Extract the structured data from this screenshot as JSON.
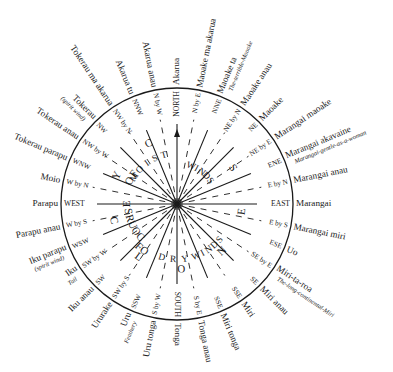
{
  "diagram": {
    "type": "wind-compass",
    "center": [
      177,
      204
    ],
    "radius": 116,
    "points": [
      {
        "label": "NORTH",
        "name": "Akarua",
        "sub": ""
      },
      {
        "label": "N by E",
        "name": "Maoake ma akarua",
        "sub": ""
      },
      {
        "label": "NNE",
        "name": "Maoake ta",
        "sub": "The-terrible-Maoake"
      },
      {
        "label": "NE by N",
        "name": "Maoake anau",
        "sub": ""
      },
      {
        "label": "NE",
        "name": "Maoake",
        "sub": ""
      },
      {
        "label": "NE by E",
        "name": "Marangai maoake",
        "sub": ""
      },
      {
        "label": "ENE",
        "name": "Marangai akavaine",
        "sub": "Marangai-gentle-as-a-woman"
      },
      {
        "label": "E by N",
        "name": "Marangai anau",
        "sub": ""
      },
      {
        "label": "EAST",
        "name": "Marangai",
        "sub": ""
      },
      {
        "label": "E by S",
        "name": "Marangai miri",
        "sub": ""
      },
      {
        "label": "ESE",
        "name": "Uo",
        "sub": ""
      },
      {
        "label": "SE by E",
        "name": "Miri-ta-roa",
        "sub": "The-long-continental-Miri"
      },
      {
        "label": "SE",
        "name": "Miri anau",
        "sub": ""
      },
      {
        "label": "SSE",
        "name": "Miri",
        "sub": ""
      },
      {
        "label": "SSE",
        "name": "Miri tonga",
        "sub": ""
      },
      {
        "label": "S by E",
        "name": "Tonga anau",
        "sub": ""
      },
      {
        "label": "SOUTH",
        "name": "Tonga",
        "sub": ""
      },
      {
        "label": "S by W",
        "name": "Uru tonga",
        "sub": ""
      },
      {
        "label": "SSW",
        "name": "Uru",
        "sub": "Feathery"
      },
      {
        "label": "SW by S",
        "name": "Ururake",
        "sub": ""
      },
      {
        "label": "SW",
        "name": "Iku anau",
        "sub": ""
      },
      {
        "label": "SW by W",
        "name": "Iku",
        "sub": "Tail"
      },
      {
        "label": "WSW",
        "name": "Iku parapu",
        "sub": "(spirit wind)"
      },
      {
        "label": "W by S",
        "name": "Parapu anau",
        "sub": ""
      },
      {
        "label": "WEST",
        "name": "Parapu",
        "sub": ""
      },
      {
        "label": "W by N",
        "name": "Moio",
        "sub": ""
      },
      {
        "label": "WNW",
        "name": "Tokerau parapu",
        "sub": ""
      },
      {
        "label": "NW by W",
        "name": "Tokerau anau",
        "sub": ""
      },
      {
        "label": "NW",
        "name": "Tokerau",
        "sub": "(spirit wind)"
      },
      {
        "label": "NW by N",
        "name": "Tokerau ma akarua",
        "sub": ""
      },
      {
        "label": "NNW",
        "name": "Akarua tu",
        "sub": ""
      },
      {
        "label": "N by W",
        "name": "Akarua anau",
        "sub": ""
      }
    ],
    "inner_text": {
      "outer_ring_left": "COURSE OF CYCLONES",
      "outer_ring_lower": "COURSE OF",
      "moist": "MOIST WINDS",
      "dry": "DRY WINDS"
    },
    "colors": {
      "ink": "#1a1a1a",
      "background": "#ffffff"
    }
  }
}
